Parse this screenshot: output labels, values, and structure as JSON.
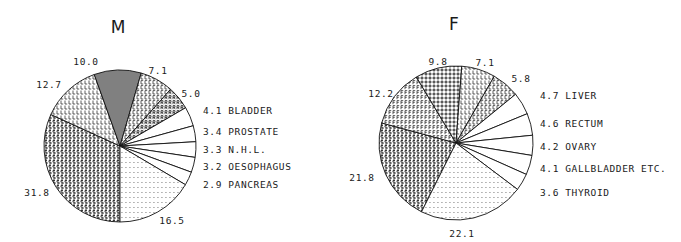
{
  "chart_data": [
    {
      "type": "pie",
      "title": "M",
      "direction": "clockwise-from-bottom",
      "slices": [
        {
          "label": "",
          "value": 31.8,
          "pattern": "S"
        },
        {
          "label": "",
          "value": 12.7,
          "pattern": "L"
        },
        {
          "label": "",
          "value": 10.0,
          "pattern": "hash"
        },
        {
          "label": "",
          "value": 7.1,
          "pattern": "C"
        },
        {
          "label": "",
          "value": 5.0,
          "pattern": "R"
        },
        {
          "label": "BLADDER",
          "value": 4.1,
          "pattern": "none"
        },
        {
          "label": "PROSTATE",
          "value": 3.4,
          "pattern": "none"
        },
        {
          "label": "N.H.L.",
          "value": 3.3,
          "pattern": "none"
        },
        {
          "label": "OESOPHAGUS",
          "value": 3.2,
          "pattern": "none"
        },
        {
          "label": "PANCREAS",
          "value": 2.9,
          "pattern": "none"
        },
        {
          "label": "",
          "value": 16.5,
          "pattern": "dots"
        }
      ],
      "value_labels": [
        "31.8",
        "12.7",
        "10.0",
        "7.1",
        "5.0",
        "4.1",
        "3.4",
        "3.3",
        "3.2",
        "2.9",
        "16.5"
      ],
      "legend_entries": [
        "4.1 BLADDER",
        "3.4 PROSTATE",
        "3.3 N.H.L.",
        "3.2 OESOPHAGUS",
        "2.9 PANCREAS"
      ]
    },
    {
      "type": "pie",
      "title": "F",
      "direction": "clockwise",
      "slices": [
        {
          "label": "",
          "value": 21.8,
          "pattern": "S"
        },
        {
          "label": "",
          "value": 12.2,
          "pattern": "F"
        },
        {
          "label": "",
          "value": 9.8,
          "pattern": "plus"
        },
        {
          "label": "",
          "value": 7.1,
          "pattern": "L"
        },
        {
          "label": "",
          "value": 5.8,
          "pattern": "C"
        },
        {
          "label": "LIVER",
          "value": 4.7,
          "pattern": "none"
        },
        {
          "label": "RECTUM",
          "value": 4.6,
          "pattern": "none"
        },
        {
          "label": "OVARY",
          "value": 4.2,
          "pattern": "none"
        },
        {
          "label": "GALLBLADDER ETC.",
          "value": 4.1,
          "pattern": "none"
        },
        {
          "label": "THYROID",
          "value": 3.6,
          "pattern": "none"
        },
        {
          "label": "",
          "value": 22.1,
          "pattern": "dots"
        }
      ],
      "value_labels": [
        "21.8",
        "12.2",
        "9.8",
        "7.1",
        "5.8",
        "4.7",
        "4.6",
        "4.2",
        "4.1",
        "3.6",
        "22.1"
      ],
      "legend_entries": [
        "4.7 LIVER",
        "4.6 RECTUM",
        "4.2 OVARY",
        "4.1 GALLBLADDER ETC.",
        "3.6 THYROID"
      ]
    }
  ],
  "charts": {
    "m": {
      "title": "M",
      "labels": {
        "v0": "31.8",
        "v1": "12.7",
        "v2": "10.0",
        "v3": "7.1",
        "v4": "5.0",
        "v10": "16.5",
        "l0": "4.1 BLADDER",
        "l1": "3.4 PROSTATE",
        "l2": "3.3 N.H.L.",
        "l3": "3.2 OESOPHAGUS",
        "l4": "2.9 PANCREAS"
      }
    },
    "f": {
      "title": "F",
      "labels": {
        "v0": "21.8",
        "v1": "12.2",
        "v2": "9.8",
        "v3": "7.1",
        "v4": "5.8",
        "v10": "22.1",
        "l0": "4.7 LIVER",
        "l1": "4.6 RECTUM",
        "l2": "4.2 OVARY",
        "l3": "4.1 GALLBLADDER ETC.",
        "l4": "3.6 THYROID"
      }
    }
  }
}
